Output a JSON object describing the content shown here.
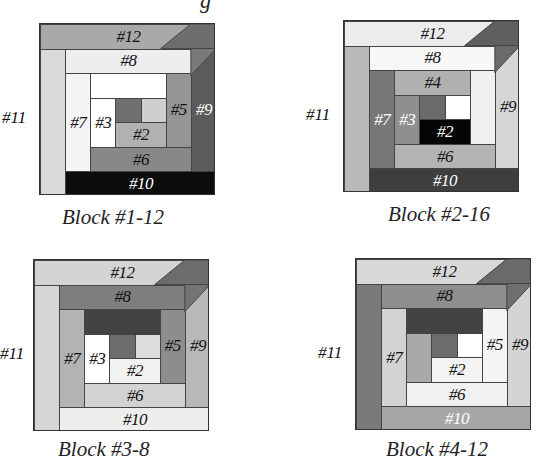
{
  "page": {
    "top_fragment": "g"
  },
  "blocks": [
    {
      "caption": "Block #1-12",
      "outside_label": "#11",
      "labels": {
        "p12": "#12",
        "p8": "#8",
        "p7": "#7",
        "p3": "#3",
        "p5": "#5",
        "p9": "#9",
        "p2": "#2",
        "p6": "#6",
        "p10": "#10"
      },
      "colors": {
        "p12": "#a9a9a9",
        "p12tri": "#6e6e6e",
        "p11": "#d9d9d9",
        "p8": "#eeeeee",
        "p9": "#5c5c5c",
        "p9tri": "#7a7a7a",
        "p7": "#f4f4f4",
        "p4": "#ffffff",
        "p5": "#959595",
        "p3": "#ffffff",
        "pc": "#6f6f6f",
        "p1": "#cfcfcf",
        "p2": "#b1b1b1",
        "p6": "#888888",
        "p10": "#0c0c0c"
      }
    },
    {
      "caption": "Block #2-16",
      "outside_label": "#11",
      "labels": {
        "p12": "#12",
        "p8": "#8",
        "p4": "#4",
        "p7": "#7",
        "p3": "#3",
        "p9": "#9",
        "p2": "#2",
        "p6": "#6",
        "p10": "#10"
      },
      "colors": {
        "p12": "#ececec",
        "p12tri": "#5f5f5f",
        "p11": "#b9b9b9",
        "p8": "#f7f7f7",
        "p9": "#d6d6d6",
        "p9tri": "#6a6a6a",
        "p7": "#777777",
        "p4": "#b0b0b0",
        "p5": "#f0f0f0",
        "p3": "#8f8f8f",
        "pc": "#6a6a6a",
        "p1": "#ffffff",
        "p2": "#050505",
        "p6": "#b4b4b4",
        "p10": "#3e3e3e"
      }
    },
    {
      "caption": "Block #3-8",
      "outside_label": "#11",
      "labels": {
        "p12": "#12",
        "p8": "#8",
        "p7": "#7",
        "p3": "#3",
        "p5": "#5",
        "p9": "#9",
        "p2": "#2",
        "p6": "#6",
        "p10": "#10"
      },
      "colors": {
        "p12": "#d3d3d3",
        "p12tri": "#6c6c6c",
        "p11": "#d6d6d6",
        "p8": "#7e7e7e",
        "p9": "#b8b8b8",
        "p9tri": "#747474",
        "p7": "#b3b3b3",
        "p4": "#424242",
        "p5": "#8d8d8d",
        "p3": "#ffffff",
        "pc": "#6c6c6c",
        "p1": "#dcdcdc",
        "p2": "#f1f1f1",
        "p6": "#d2d2d2",
        "p10": "#eeeeee"
      }
    },
    {
      "caption": "Block #4-12",
      "outside_label": "#11",
      "labels": {
        "p12": "#12",
        "p8": "#8",
        "p7": "#7",
        "p5": "#5",
        "p9": "#9",
        "p2": "#2",
        "p6": "#6",
        "p10": "#10"
      },
      "colors": {
        "p12": "#d8d8d8",
        "p12tri": "#6a6a6a",
        "p11": "#7a7a7a",
        "p8": "#8e8e8e",
        "p9": "#d4d4d4",
        "p9tri": "#6f6f6f",
        "p7": "#d3d3d3",
        "p4": "#424242",
        "p5": "#f4f4f4",
        "p3": "#a9a9a9",
        "pc": "#6c6c6c",
        "p1": "#ffffff",
        "p2": "#f3f3f3",
        "p6": "#f1f1f1",
        "p10": "#a6a6a6"
      }
    }
  ]
}
